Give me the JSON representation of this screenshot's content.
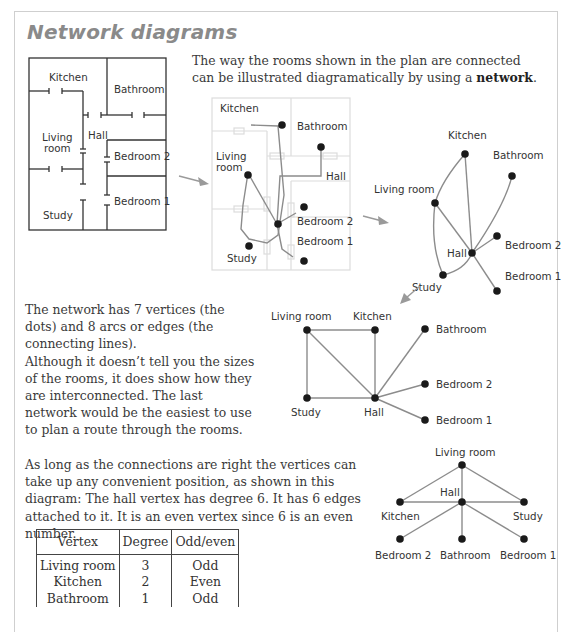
{
  "page": {
    "title": "Network diagrams",
    "intro": {
      "text_before": "The way the rooms shown in the plan are connected can be illustrated diagramatically by using a ",
      "bold": "network",
      "text_after": "."
    },
    "paragraph_2": "The network has 7 vertices (the dots) and 8 arcs or edges (the connecting lines).\nAlthough it doesn’t tell you the sizes of the rooms, it does show how they are interconnected. The last network would be the easiest to use to plan a route through the rooms.",
    "paragraph_3": "As long as the connections are right the vertices can take up any convenient position, as shown in this diagram: The hall vertex has degree 6. It has 6 edges attached to it. It is an even vertex since 6 is an even number."
  },
  "floor_plan": {
    "rooms": {
      "kitchen": "Kitchen",
      "bathroom": "Bathroom",
      "living_1": "Living",
      "living_2": "room",
      "hall": "Hall",
      "bedroom2": "Bedroom 2",
      "bedroom1": "Bedroom 1",
      "study": "Study"
    }
  },
  "network_overlay": {
    "labels": {
      "kitchen": "Kitchen",
      "bathroom": "Bathroom",
      "living_1": "Living",
      "living_2": "room",
      "hall": "Hall",
      "bedroom2": "Bedroom 2",
      "bedroom1": "Bedroom 1",
      "study": "Study"
    }
  },
  "network_curved": {
    "labels": {
      "kitchen": "Kitchen",
      "bathroom": "Bathroom",
      "living": "Living room",
      "hall": "Hall",
      "bedroom2": "Bedroom 2",
      "bedroom1": "Bedroom 1",
      "study": "Study"
    }
  },
  "network_square": {
    "labels": {
      "living": "Living room",
      "kitchen": "Kitchen",
      "bathroom": "Bathroom",
      "bedroom2": "Bedroom 2",
      "study": "Study",
      "hall": "Hall",
      "bedroom1": "Bedroom 1"
    }
  },
  "network_tree": {
    "labels": {
      "living": "Living room",
      "hall": "Hall",
      "kitchen": "Kitchen",
      "study": "Study",
      "bedroom2": "Bedroom 2",
      "bathroom": "Bathroom",
      "bedroom1": "Bedroom 1"
    }
  },
  "degree_table": {
    "headers": [
      "Vertex",
      "Degree",
      "Odd/even"
    ],
    "rows": [
      [
        "Living room",
        "3",
        "Odd"
      ],
      [
        "Kitchen",
        "2",
        "Even"
      ],
      [
        "Bathroom",
        "1",
        "Odd"
      ]
    ]
  },
  "colors": {
    "title": "#8a8a8a",
    "edge": "#8c8c8c",
    "vertex": "#1a1a1a",
    "arrow": "#9a9a9a",
    "grid": "#dcdcdc"
  }
}
